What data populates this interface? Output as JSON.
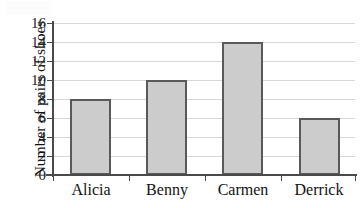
{
  "chart_data": {
    "type": "bar",
    "title": "",
    "xlabel": "",
    "ylabel": "Number of pairs of shoes",
    "categories": [
      "Alicia",
      "Benny",
      "Carmen",
      "Derrick"
    ],
    "values": [
      8,
      10,
      14,
      6
    ],
    "ylim": [
      0,
      16
    ],
    "ytick_labels": [
      "0",
      "2",
      "4",
      "6",
      "8",
      "10",
      "12",
      "14",
      "16"
    ],
    "ytick_values": [
      0,
      2,
      4,
      6,
      8,
      10,
      12,
      14,
      16
    ],
    "grid": "horizontal",
    "legend": "none",
    "series": [
      {
        "name": "Number of pairs of shoes",
        "values": [
          8,
          10,
          14,
          6
        ]
      }
    ],
    "colors": {
      "bar_fill": "#cccccc",
      "bar_border": "#595959",
      "gridline": "#d8d8d8",
      "axis": "#4a4a4a",
      "text": "#111111",
      "background": "#ffffff"
    }
  }
}
